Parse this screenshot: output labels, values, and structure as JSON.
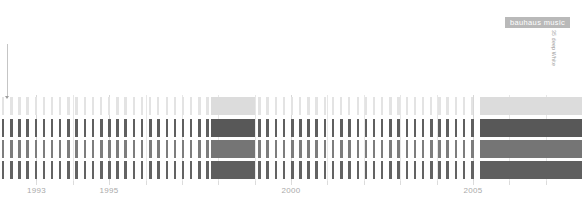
{
  "badge": {
    "label": "bauhaus music",
    "bg": "#b9b9b9",
    "fg": "#ffffff"
  },
  "annotation": {
    "label": "35 deep White",
    "color": "#9a9a9a"
  },
  "axis": {
    "labels": [
      "1993",
      "1995",
      "2000",
      "2005"
    ],
    "label_color": "#aaaaaa"
  },
  "palette": {
    "background": "#ffffff",
    "row1_tick": "#e3e3e3",
    "row1_block": "#dcdcdc",
    "row2_tick": "#5f5f5f",
    "row2_block": "#585858",
    "row3_tick": "#7d7d7d",
    "row3_block": "#757575",
    "row4_tick": "#636363",
    "row4_block": "#5f5f5f",
    "gridline": "#e7e7e7",
    "gridline_major": "#d8d8d8"
  },
  "chart_data": {
    "type": "bar",
    "title": "bauhaus music",
    "xlabel": "",
    "ylabel": "",
    "xlim": [
      1992.0,
      2008.0
    ],
    "x_tick_values": [
      1993,
      1995,
      2000,
      2005
    ],
    "x_tick_labels": [
      "1993",
      "1995",
      "2000",
      "2005"
    ],
    "grid": true,
    "legend": "none",
    "note": "Four stacked categorical rows of per-release tick marks along a time axis; highlighted solid spans mark two release clusters (1997.8-1999.0 and 2005.2-2008.0).",
    "series": [
      {
        "name": "row-1",
        "color": "#e3e3e3",
        "block_color": "#dcdcdc",
        "y_top": 2,
        "height": 18,
        "x": [
          1992.05,
          1992.28,
          1992.5,
          1992.72,
          1992.95,
          1993.17,
          1993.4,
          1993.62,
          1993.85,
          1994.07,
          1994.3,
          1994.52,
          1994.75,
          1994.97,
          1995.2,
          1995.42,
          1995.65,
          1995.87,
          1996.1,
          1996.32,
          1996.55,
          1996.77,
          1997.0,
          1997.22,
          1997.45,
          1997.67,
          1999.1,
          1999.32,
          1999.55,
          1999.77,
          2000.0,
          2000.22,
          2000.45,
          2000.67,
          2000.9,
          2001.12,
          2001.35,
          2001.57,
          2001.8,
          2002.02,
          2002.25,
          2002.47,
          2002.7,
          2002.92,
          2003.15,
          2003.37,
          2003.6,
          2003.82,
          2004.05,
          2004.27,
          2004.5,
          2004.72,
          2004.95
        ],
        "values": [
          1,
          1,
          1,
          1,
          1,
          1,
          1,
          1,
          1,
          1,
          1,
          1,
          1,
          1,
          1,
          1,
          1,
          1,
          1,
          1,
          1,
          1,
          1,
          1,
          1,
          1,
          1,
          1,
          1,
          1,
          1,
          1,
          1,
          1,
          1,
          1,
          1,
          1,
          1,
          1,
          1,
          1,
          1,
          1,
          1,
          1,
          1,
          1,
          1,
          1,
          1,
          1,
          1
        ],
        "blocks": [
          [
            1997.8,
            1999.0
          ],
          [
            2005.2,
            2008.0
          ]
        ]
      },
      {
        "name": "row-2",
        "color": "#5f5f5f",
        "block_color": "#585858",
        "y_top": 24,
        "height": 18,
        "x": [
          1992.05,
          1992.28,
          1992.5,
          1992.72,
          1992.95,
          1993.17,
          1993.4,
          1993.62,
          1993.85,
          1994.07,
          1994.3,
          1994.52,
          1994.75,
          1994.97,
          1995.2,
          1995.42,
          1995.65,
          1995.87,
          1996.1,
          1996.32,
          1996.55,
          1996.77,
          1997.0,
          1997.22,
          1997.45,
          1997.67,
          1999.1,
          1999.32,
          1999.55,
          1999.77,
          2000.0,
          2000.22,
          2000.45,
          2000.67,
          2000.9,
          2001.12,
          2001.35,
          2001.57,
          2001.8,
          2002.02,
          2002.25,
          2002.47,
          2002.7,
          2002.92,
          2003.15,
          2003.37,
          2003.6,
          2003.82,
          2004.05,
          2004.27,
          2004.5,
          2004.72,
          2004.95
        ],
        "values": [
          1,
          1,
          1,
          1,
          1,
          1,
          1,
          1,
          1,
          1,
          1,
          1,
          1,
          1,
          1,
          1,
          1,
          1,
          1,
          1,
          1,
          1,
          1,
          1,
          1,
          1,
          1,
          1,
          1,
          1,
          1,
          1,
          1,
          1,
          1,
          1,
          1,
          1,
          1,
          1,
          1,
          1,
          1,
          1,
          1,
          1,
          1,
          1,
          1,
          1,
          1,
          1,
          1
        ],
        "blocks": [
          [
            1997.8,
            1999.0
          ],
          [
            2005.2,
            2008.0
          ]
        ]
      },
      {
        "name": "row-3",
        "color": "#7d7d7d",
        "block_color": "#757575",
        "y_top": 45,
        "height": 18,
        "x": [
          1992.05,
          1992.28,
          1992.5,
          1992.72,
          1992.95,
          1993.17,
          1993.4,
          1993.62,
          1993.85,
          1994.07,
          1994.3,
          1994.52,
          1994.75,
          1994.97,
          1995.2,
          1995.42,
          1995.65,
          1995.87,
          1996.1,
          1996.32,
          1996.55,
          1996.77,
          1997.0,
          1997.22,
          1997.45,
          1997.67,
          1999.1,
          1999.32,
          1999.55,
          1999.77,
          2000.0,
          2000.22,
          2000.45,
          2000.67,
          2000.9,
          2001.12,
          2001.35,
          2001.57,
          2001.8,
          2002.02,
          2002.25,
          2002.47,
          2002.7,
          2002.92,
          2003.15,
          2003.37,
          2003.6,
          2003.82,
          2004.05,
          2004.27,
          2004.5,
          2004.72,
          2004.95
        ],
        "values": [
          1,
          1,
          1,
          1,
          1,
          1,
          1,
          1,
          1,
          1,
          1,
          1,
          1,
          1,
          1,
          1,
          1,
          1,
          1,
          1,
          1,
          1,
          1,
          1,
          1,
          1,
          1,
          1,
          1,
          1,
          1,
          1,
          1,
          1,
          1,
          1,
          1,
          1,
          1,
          1,
          1,
          1,
          1,
          1,
          1,
          1,
          1,
          1,
          1,
          1,
          1,
          1,
          1
        ],
        "blocks": [
          [
            1997.8,
            1999.0
          ],
          [
            2005.2,
            2008.0
          ]
        ]
      },
      {
        "name": "row-4",
        "color": "#636363",
        "block_color": "#5f5f5f",
        "y_top": 66,
        "height": 18,
        "x": [
          1992.05,
          1992.28,
          1992.5,
          1992.72,
          1992.95,
          1993.17,
          1993.4,
          1993.62,
          1993.85,
          1994.07,
          1994.3,
          1994.52,
          1994.75,
          1994.97,
          1995.2,
          1995.42,
          1995.65,
          1995.87,
          1996.1,
          1996.32,
          1996.55,
          1996.77,
          1997.0,
          1997.22,
          1997.45,
          1997.67,
          1999.1,
          1999.32,
          1999.55,
          1999.77,
          2000.0,
          2000.22,
          2000.45,
          2000.67,
          2000.9,
          2001.12,
          2001.35,
          2001.57,
          2001.8,
          2002.02,
          2002.25,
          2002.47,
          2002.7,
          2002.92,
          2003.15,
          2003.37,
          2003.6,
          2003.82,
          2004.05,
          2004.27,
          2004.5,
          2004.72,
          2004.95
        ],
        "values": [
          1,
          1,
          1,
          1,
          1,
          1,
          1,
          1,
          1,
          1,
          1,
          1,
          1,
          1,
          1,
          1,
          1,
          1,
          1,
          1,
          1,
          1,
          1,
          1,
          1,
          1,
          1,
          1,
          1,
          1,
          1,
          1,
          1,
          1,
          1,
          1,
          1,
          1,
          1,
          1,
          1,
          1,
          1,
          1,
          1,
          1,
          1,
          1,
          1,
          1,
          1,
          1,
          1
        ],
        "blocks": [
          [
            1997.8,
            1999.0
          ],
          [
            2005.2,
            2008.0
          ]
        ]
      }
    ],
    "gridlines_major": [
      1993,
      1995,
      2000,
      2005
    ],
    "gridlines_minor": [
      1994,
      1996,
      1997,
      1998,
      1999,
      2001,
      2002,
      2003,
      2004,
      2006,
      2007
    ]
  }
}
